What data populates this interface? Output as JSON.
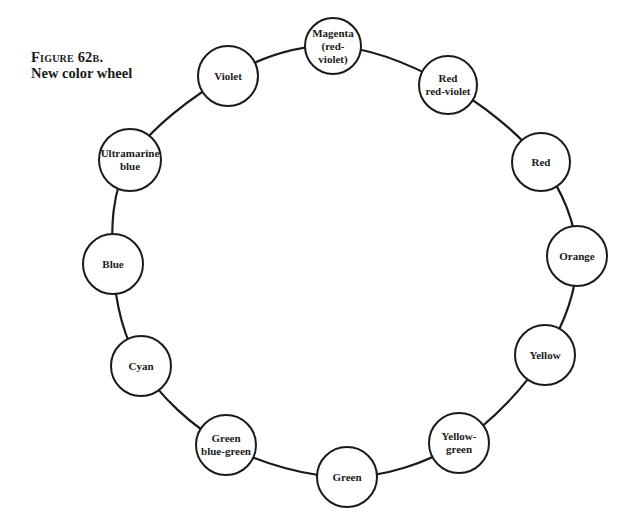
{
  "caption": {
    "label": "Figure 62b.",
    "title": "New color wheel"
  },
  "wheel": {
    "stroke_color": "#1a1a1a",
    "nodes": [
      {
        "id": "magenta",
        "line1": "Magenta",
        "line2": "(red-violet)",
        "cx": 333,
        "cy": 46,
        "r": 29
      },
      {
        "id": "red-red-violet",
        "line1": "Red",
        "line2": "red-violet",
        "cx": 448,
        "cy": 85,
        "r": 30
      },
      {
        "id": "red",
        "line1": "Red",
        "line2": "",
        "cx": 541,
        "cy": 162,
        "r": 30
      },
      {
        "id": "orange",
        "line1": "Orange",
        "line2": "",
        "cx": 577,
        "cy": 256,
        "r": 31
      },
      {
        "id": "yellow",
        "line1": "Yellow",
        "line2": "",
        "cx": 545,
        "cy": 355,
        "r": 31
      },
      {
        "id": "yellow-green",
        "line1": "Yellow-",
        "line2": "green",
        "cx": 459,
        "cy": 443,
        "r": 31
      },
      {
        "id": "green",
        "line1": "Green",
        "line2": "",
        "cx": 347,
        "cy": 477,
        "r": 31
      },
      {
        "id": "green-blue-green",
        "line1": "Green",
        "line2": "blue-green",
        "cx": 226,
        "cy": 445,
        "r": 31
      },
      {
        "id": "cyan",
        "line1": "Cyan",
        "line2": "",
        "cx": 141,
        "cy": 366,
        "r": 31
      },
      {
        "id": "blue",
        "line1": "Blue",
        "line2": "",
        "cx": 113,
        "cy": 264,
        "r": 31
      },
      {
        "id": "ultramarine-blue",
        "line1": "Ultramarine",
        "line2": "blue",
        "cx": 130,
        "cy": 160,
        "r": 32
      },
      {
        "id": "violet",
        "line1": "Violet",
        "line2": "",
        "cx": 228,
        "cy": 76,
        "r": 31
      }
    ]
  }
}
